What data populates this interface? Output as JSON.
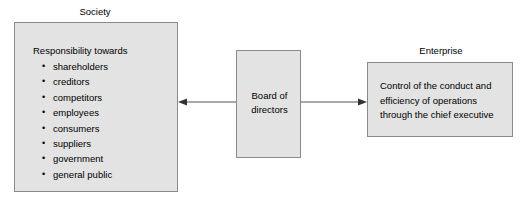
{
  "diagram": {
    "background_color": "#ffffff",
    "box_fill_color": "#e3e3e3",
    "box_border_color": "#8a8a8a",
    "text_color": "#000000"
  },
  "society": {
    "caption": "Society",
    "heading": "Responsibility towards",
    "items": [
      "shareholders",
      "creditors",
      "competitors",
      "employees",
      "consumers",
      "suppliers",
      "government",
      "general public"
    ]
  },
  "board": {
    "line1": "Board of",
    "line2": "directors"
  },
  "enterprise": {
    "caption": "Enterprise",
    "line1": "Control of the conduct and",
    "line2": "efficiency of operations",
    "line3": "through the chief executive"
  },
  "connectors": {
    "board_to_society": "arrow-left",
    "board_to_enterprise": "arrow-right"
  }
}
